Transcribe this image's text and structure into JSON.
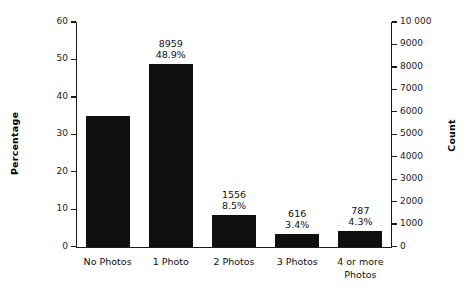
{
  "chart_data": {
    "type": "bar",
    "title": "",
    "xlabel": "",
    "ylabel": "Percentage",
    "y2label": "Count",
    "categories": [
      "No Photos",
      "1 Photo",
      "2 Photos",
      "3 Photos",
      "4 or more Photos"
    ],
    "values": [
      35.0,
      48.9,
      8.5,
      3.4,
      4.3
    ],
    "counts": [
      6411,
      8959,
      1556,
      616,
      787
    ],
    "series": [
      {
        "name": "Percentage of records",
        "values": [
          35.0,
          48.9,
          8.5,
          3.4,
          4.3
        ]
      }
    ],
    "point_labels": [
      {
        "count": "",
        "pct": ""
      },
      {
        "count": "8959",
        "pct": "48.9%"
      },
      {
        "count": "1556",
        "pct": "8.5%"
      },
      {
        "count": "616",
        "pct": "3.4%"
      },
      {
        "count": "787",
        "pct": "4.3%"
      }
    ],
    "ylim": [
      0,
      60
    ],
    "y2lim": [
      0,
      10000
    ],
    "yticks": [
      "0",
      "10",
      "20",
      "30",
      "40",
      "50",
      "60"
    ],
    "ytick_values": [
      0,
      10,
      20,
      30,
      40,
      50,
      60
    ],
    "y2ticks": [
      "0",
      "1000",
      "2000",
      "3000",
      "4000",
      "5000",
      "6000",
      "7000",
      "8000",
      "9000",
      "10 000"
    ],
    "y2tick_values": [
      0,
      1000,
      2000,
      3000,
      4000,
      5000,
      6000,
      7000,
      8000,
      9000,
      10000
    ],
    "grid": false,
    "legend": false,
    "legend_position": "none",
    "bar_color": "#100f0f",
    "axis_color": "#1b1b1b",
    "background_color": "#ffffff"
  }
}
